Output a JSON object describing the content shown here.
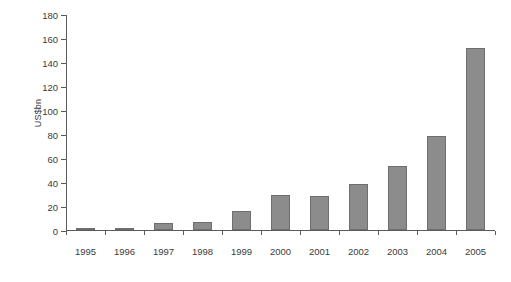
{
  "chart_data": {
    "type": "bar",
    "title": "",
    "subtitle": "",
    "xlabel": "",
    "ylabel": "US$bn",
    "categories": [
      "1995",
      "1996",
      "1997",
      "1998",
      "1999",
      "2000",
      "2001",
      "2002",
      "2003",
      "2004",
      "2005"
    ],
    "values": [
      1,
      2,
      6,
      7,
      16,
      29,
      28,
      38,
      53,
      78,
      152
    ],
    "ylim": [
      0,
      180
    ],
    "ytick_step": 20,
    "yticks": [
      0,
      20,
      40,
      60,
      80,
      100,
      120,
      140,
      160,
      180
    ],
    "ytick_labels": [
      "0",
      "20",
      "40",
      "60",
      "80",
      "100",
      "120",
      "140",
      "160",
      "180"
    ],
    "grid": false,
    "legend": false,
    "legend_position": "none",
    "bar_color": "#8c8c8c",
    "bar_edge_color": "#6e6e6e",
    "axis_color": "#5b5b5b",
    "background_color": "#ffffff",
    "text_color": "#3b3b3b"
  }
}
